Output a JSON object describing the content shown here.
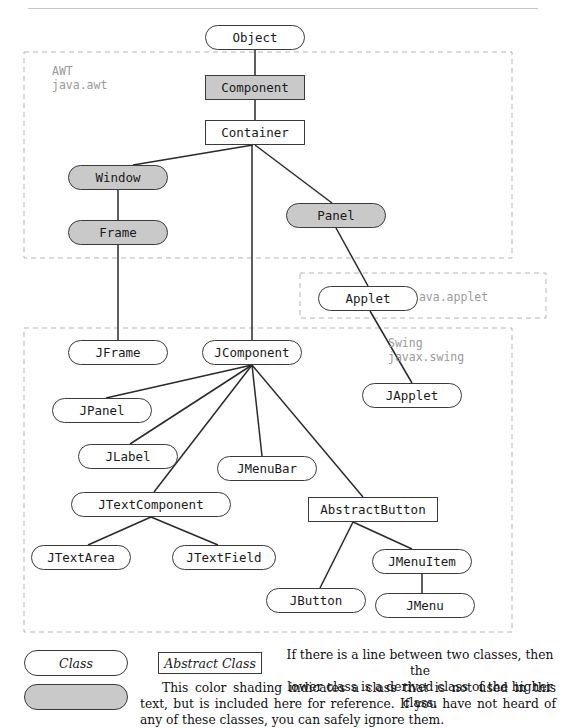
{
  "figure": {
    "top_rule": true
  },
  "packages": [
    {
      "id": "awt",
      "label": "AWT\njava.awt",
      "label_x": 52,
      "label_y": 64,
      "box": {
        "x": 24,
        "y": 52,
        "w": 488,
        "h": 206
      }
    },
    {
      "id": "applet",
      "label": "java.applet",
      "label_x": 412,
      "label_y": 290,
      "box": {
        "x": 300,
        "y": 273,
        "w": 246,
        "h": 45
      }
    },
    {
      "id": "swing",
      "label": "Swing\njavax.swing",
      "label_x": 388,
      "label_y": 336,
      "box": {
        "x": 24,
        "y": 328,
        "w": 488,
        "h": 304
      }
    }
  ],
  "nodes": [
    {
      "id": "object",
      "label": "Object",
      "shape": "rounded",
      "shaded": false,
      "x": 205,
      "y": 25,
      "w": 100,
      "h": 25
    },
    {
      "id": "component",
      "label": "Component",
      "shape": "rect",
      "shaded": true,
      "x": 205,
      "y": 75,
      "w": 100,
      "h": 25
    },
    {
      "id": "container",
      "label": "Container",
      "shape": "rect",
      "shaded": false,
      "x": 205,
      "y": 120,
      "w": 100,
      "h": 25
    },
    {
      "id": "window",
      "label": "Window",
      "shape": "rounded",
      "shaded": true,
      "x": 68,
      "y": 165,
      "w": 100,
      "h": 25
    },
    {
      "id": "frame",
      "label": "Frame",
      "shape": "rounded",
      "shaded": true,
      "x": 68,
      "y": 220,
      "w": 100,
      "h": 25
    },
    {
      "id": "panel",
      "label": "Panel",
      "shape": "rounded",
      "shaded": true,
      "x": 286,
      "y": 203,
      "w": 100,
      "h": 25
    },
    {
      "id": "applet",
      "label": "Applet",
      "shape": "rounded",
      "shaded": false,
      "x": 318,
      "y": 286,
      "w": 100,
      "h": 25
    },
    {
      "id": "japplet",
      "label": "JApplet",
      "shape": "rounded",
      "shaded": false,
      "x": 362,
      "y": 383,
      "w": 100,
      "h": 25
    },
    {
      "id": "jframe",
      "label": "JFrame",
      "shape": "rounded",
      "shaded": false,
      "x": 68,
      "y": 340,
      "w": 100,
      "h": 25
    },
    {
      "id": "jcomponent",
      "label": "JComponent",
      "shape": "rounded",
      "shaded": false,
      "x": 202,
      "y": 340,
      "w": 100,
      "h": 25
    },
    {
      "id": "jpanel",
      "label": "JPanel",
      "shape": "rounded",
      "shaded": false,
      "x": 52,
      "y": 398,
      "w": 100,
      "h": 25
    },
    {
      "id": "jlabel",
      "label": "JLabel",
      "shape": "rounded",
      "shaded": false,
      "x": 78,
      "y": 444,
      "w": 100,
      "h": 25
    },
    {
      "id": "jmenubar",
      "label": "JMenuBar",
      "shape": "rounded",
      "shaded": false,
      "x": 217,
      "y": 456,
      "w": 100,
      "h": 25
    },
    {
      "id": "jtextcomponent",
      "label": "JTextComponent",
      "shape": "rounded",
      "shaded": false,
      "x": 71,
      "y": 492,
      "w": 160,
      "h": 25
    },
    {
      "id": "abstractbutton",
      "label": "AbstractButton",
      "shape": "rect",
      "shaded": false,
      "x": 308,
      "y": 497,
      "w": 130,
      "h": 25
    },
    {
      "id": "jtextarea",
      "label": "JTextArea",
      "shape": "rounded",
      "shaded": false,
      "x": 31,
      "y": 545,
      "w": 100,
      "h": 25
    },
    {
      "id": "jtextfield",
      "label": "JTextField",
      "shape": "rounded",
      "shaded": false,
      "x": 172,
      "y": 545,
      "w": 104,
      "h": 25
    },
    {
      "id": "jmenuitem",
      "label": "JMenuItem",
      "shape": "rounded",
      "shaded": false,
      "x": 372,
      "y": 549,
      "w": 100,
      "h": 25
    },
    {
      "id": "jbutton",
      "label": "JButton",
      "shape": "rounded",
      "shaded": false,
      "x": 266,
      "y": 588,
      "w": 100,
      "h": 25
    },
    {
      "id": "jmenu",
      "label": "JMenu",
      "shape": "rounded",
      "shaded": false,
      "x": 375,
      "y": 593,
      "w": 100,
      "h": 25
    }
  ],
  "edges": [
    {
      "from": "Object",
      "to": "Component",
      "x1": 255,
      "y1": 50,
      "x2": 255,
      "y2": 75
    },
    {
      "from": "Component",
      "to": "Container",
      "x1": 255,
      "y1": 100,
      "x2": 255,
      "y2": 120
    },
    {
      "from": "Container",
      "to": "Window",
      "x1": 253,
      "y1": 145,
      "x2": 133,
      "y2": 165
    },
    {
      "from": "Container",
      "to": "Panel",
      "x1": 255,
      "y1": 145,
      "x2": 332,
      "y2": 203
    },
    {
      "from": "Container",
      "to": "JComponent",
      "x1": 252,
      "y1": 145,
      "x2": 252,
      "y2": 340
    },
    {
      "from": "Window",
      "to": "Frame",
      "x1": 118,
      "y1": 190,
      "x2": 118,
      "y2": 220
    },
    {
      "from": "Frame",
      "to": "JFrame",
      "x1": 118,
      "y1": 245,
      "x2": 118,
      "y2": 340
    },
    {
      "from": "Panel",
      "to": "Applet",
      "x1": 336,
      "y1": 228,
      "x2": 368,
      "y2": 286
    },
    {
      "from": "Applet",
      "to": "JApplet",
      "x1": 370,
      "y1": 311,
      "x2": 412,
      "y2": 383
    },
    {
      "from": "JComponent",
      "to": "JPanel",
      "x1": 252,
      "y1": 365,
      "x2": 106,
      "y2": 398
    },
    {
      "from": "JComponent",
      "to": "JLabel",
      "x1": 252,
      "y1": 365,
      "x2": 130,
      "y2": 444
    },
    {
      "from": "JComponent",
      "to": "JTextComponent",
      "x1": 252,
      "y1": 365,
      "x2": 154,
      "y2": 492
    },
    {
      "from": "JComponent",
      "to": "JMenuBar",
      "x1": 252,
      "y1": 365,
      "x2": 262,
      "y2": 456
    },
    {
      "from": "JComponent",
      "to": "AbstractButton",
      "x1": 252,
      "y1": 365,
      "x2": 363,
      "y2": 497
    },
    {
      "from": "JTextComponent",
      "to": "JTextArea",
      "x1": 151,
      "y1": 517,
      "x2": 88,
      "y2": 545
    },
    {
      "from": "JTextComponent",
      "to": "JTextField",
      "x1": 151,
      "y1": 517,
      "x2": 218,
      "y2": 545
    },
    {
      "from": "AbstractButton",
      "to": "JButton",
      "x1": 353,
      "y1": 522,
      "x2": 320,
      "y2": 588
    },
    {
      "from": "AbstractButton",
      "to": "JMenuItem",
      "x1": 353,
      "y1": 522,
      "x2": 412,
      "y2": 549
    },
    {
      "from": "JMenuItem",
      "to": "JMenu",
      "x1": 422,
      "y1": 574,
      "x2": 422,
      "y2": 593
    }
  ],
  "legend": {
    "class_label": "Class",
    "abstract_label": "Abstract Class",
    "line_note": "If there is a line between two classes, then the\nlower class is a derived class of the higher class.",
    "shading_note": "This color shading indicates a class that is not used in this text, but is included here for reference. If you have not heard of any of these classes, you can safely ignore them.",
    "class_box": {
      "x": 24,
      "y": 650,
      "w": 104,
      "h": 26
    },
    "abstract_box": {
      "x": 158,
      "y": 652,
      "w": 104,
      "h": 22
    },
    "shaded_box": {
      "x": 24,
      "y": 684,
      "w": 104,
      "h": 26
    },
    "line_note_pos": {
      "x": 285,
      "y": 647,
      "w": 270
    },
    "shading_note_pos": {
      "x": 140,
      "y": 680,
      "w": 416
    }
  },
  "colors": {
    "node_border": "#3a3a3a",
    "node_fill": "#ffffff",
    "shaded_fill": "#c9c9c9",
    "edge": "#2a2a2a",
    "package_dash": "#b5b5b5",
    "package_label": "#9a9a9a",
    "text": "#1a1a1a",
    "rule": "#c4c4c4"
  }
}
